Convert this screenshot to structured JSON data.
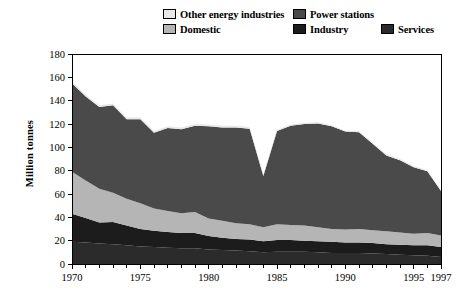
{
  "legend": {
    "rows": [
      [
        {
          "label": "Other energy industries",
          "color": "#e8e8e8",
          "name": "legend-other-energy-industries"
        },
        {
          "label": "Power stations",
          "color": "#4a4a4a",
          "name": "legend-power-stations"
        }
      ],
      [
        {
          "label": "Domestic",
          "color": "#b5b5b5",
          "name": "legend-domestic"
        },
        {
          "label": "Industry",
          "color": "#1c1c1c",
          "name": "legend-industry"
        },
        {
          "label": "Services",
          "color": "#2b2b2b",
          "name": "legend-services"
        }
      ]
    ]
  },
  "axes": {
    "ylabel": "Million tonnes",
    "yticks": [
      "180",
      "160",
      "140",
      "120",
      "100",
      "80",
      "60",
      "40",
      "20",
      "0"
    ],
    "xticks": [
      "1970",
      "1975",
      "1980",
      "1985",
      "1990",
      "1995",
      "1997"
    ]
  },
  "chart_data": {
    "type": "area",
    "stacked": true,
    "title": "",
    "xlabel": "",
    "ylabel": "Million tonnes",
    "ylim": [
      0,
      180
    ],
    "xlim": [
      1970,
      1997
    ],
    "ytick_values": [
      0,
      20,
      40,
      60,
      80,
      100,
      120,
      140,
      160,
      180
    ],
    "xtick_values": [
      1970,
      1975,
      1980,
      1985,
      1990,
      1995,
      1997
    ],
    "grid": false,
    "legend_position": "top",
    "x": [
      1970,
      1971,
      1972,
      1973,
      1974,
      1975,
      1976,
      1977,
      1978,
      1979,
      1980,
      1981,
      1982,
      1983,
      1984,
      1985,
      1986,
      1987,
      1988,
      1989,
      1990,
      1991,
      1992,
      1993,
      1994,
      1995,
      1996,
      1997
    ],
    "series": [
      {
        "name": "Services",
        "color": "#2b2b2b",
        "order": 1,
        "values": [
          19.0,
          18.5,
          17.5,
          17.0,
          16.0,
          15.0,
          14.5,
          14.0,
          13.5,
          13.5,
          12.5,
          12.0,
          11.5,
          11.0,
          10.0,
          10.5,
          10.5,
          10.5,
          10.0,
          9.5,
          9.5,
          9.5,
          9.0,
          8.5,
          8.0,
          7.5,
          7.0,
          6.0
        ]
      },
      {
        "name": "Industry",
        "color": "#1c1c1c",
        "order": 2,
        "values": [
          24.0,
          21.0,
          18.0,
          19.0,
          17.0,
          15.0,
          14.0,
          13.5,
          13.0,
          13.0,
          11.5,
          10.5,
          10.0,
          10.0,
          9.5,
          10.0,
          10.0,
          9.5,
          9.5,
          9.5,
          9.0,
          9.0,
          9.0,
          8.5,
          8.5,
          8.5,
          9.0,
          8.5
        ]
      },
      {
        "name": "Domestic",
        "color": "#b5b5b5",
        "order": 3,
        "values": [
          36.0,
          32.0,
          29.0,
          25.0,
          23.0,
          22.0,
          19.0,
          18.0,
          17.0,
          18.0,
          15.0,
          14.5,
          13.5,
          13.0,
          12.0,
          13.5,
          13.0,
          13.0,
          12.0,
          11.0,
          11.0,
          11.5,
          11.0,
          11.0,
          10.5,
          10.0,
          10.5,
          10.0
        ]
      },
      {
        "name": "Power stations",
        "color": "#4a4a4a",
        "order": 4,
        "values": [
          76.0,
          72.0,
          70.0,
          75.0,
          68.0,
          72.0,
          65.0,
          71.0,
          72.0,
          74.0,
          79.0,
          80.0,
          82.0,
          82.0,
          44.0,
          80.0,
          85.0,
          87.0,
          89.0,
          88.0,
          84.0,
          83.0,
          74.0,
          65.0,
          62.0,
          57.0,
          53.0,
          38.0
        ]
      },
      {
        "name": "Other energy industries",
        "color": "#e8e8e8",
        "order": 5,
        "values": [
          1.5,
          1.5,
          1.5,
          1.5,
          1.5,
          1.5,
          1.5,
          1.5,
          1.5,
          1.5,
          1.5,
          1.5,
          1.5,
          1.5,
          1.0,
          1.0,
          1.0,
          1.0,
          1.0,
          1.0,
          1.0,
          1.0,
          1.0,
          1.0,
          1.0,
          1.0,
          1.0,
          1.0
        ]
      }
    ],
    "totals": [
      156.5,
      145.0,
      136.0,
      137.5,
      125.5,
      125.5,
      114.0,
      118.0,
      117.0,
      120.0,
      119.5,
      118.5,
      118.5,
      117.5,
      76.5,
      115.0,
      119.5,
      121.0,
      121.5,
      119.0,
      114.5,
      114.0,
      104.0,
      94.0,
      90.0,
      84.0,
      80.5,
      63.5
    ]
  }
}
